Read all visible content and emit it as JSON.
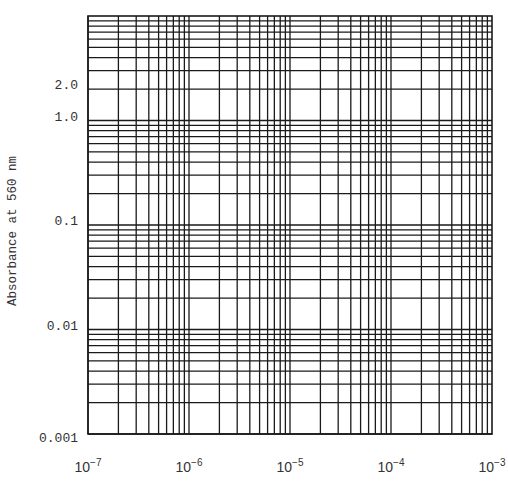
{
  "chart_data": {
    "type": "line",
    "title": "",
    "xlabel": "",
    "ylabel": "Absorbance at 560 nm",
    "x_scale": "log",
    "y_scale": "log",
    "xlim": [
      1e-07,
      0.001
    ],
    "ylim": [
      0.001,
      10
    ],
    "x_tick_labels": [
      {
        "base": "10",
        "exp": "-7",
        "value": 1e-07
      },
      {
        "base": "10",
        "exp": "-6",
        "value": 1e-06
      },
      {
        "base": "10",
        "exp": "-5",
        "value": 1e-05
      },
      {
        "base": "10",
        "exp": "-4",
        "value": 0.0001
      },
      {
        "base": "10",
        "exp": "-3",
        "value": 0.001
      }
    ],
    "y_tick_labels": [
      {
        "label": "2.0",
        "value": 2
      },
      {
        "label": "1.0",
        "value": 1
      },
      {
        "label": "0.1",
        "value": 0.1
      },
      {
        "label": "0.01",
        "value": 0.01
      },
      {
        "label": "0.001",
        "value": 0.001
      }
    ],
    "grid": true,
    "grid_style": "log-log graph paper, minor lines at 1-9 per decade",
    "series": [],
    "legend": null
  },
  "layout": {
    "plot_left": 88,
    "plot_right": 492,
    "plot_top": 16,
    "plot_bottom": 434,
    "line_color": "#1a1a1a"
  }
}
